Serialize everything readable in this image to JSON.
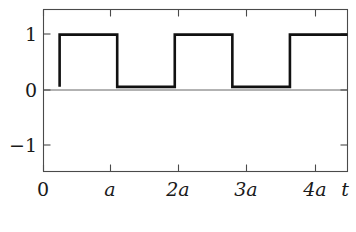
{
  "figure": {
    "kind": "mathematical-plot",
    "caption_partial": "",
    "background_color": "#ffffff",
    "frame_color": "#4a4a4a",
    "curve_color": "#111111"
  },
  "chart_data": {
    "type": "line",
    "title": "",
    "subtitle": "",
    "xlabel": "t",
    "ylabel": "",
    "grid": false,
    "legend": null,
    "legend_position": "none",
    "step_interpolation": "post",
    "xlim": [
      -0.28,
      5.0
    ],
    "ylim": [
      -1.62,
      1.48
    ],
    "xticks": [
      0,
      1,
      2,
      3,
      4
    ],
    "xticklabels": [
      "0",
      "a",
      "2a",
      "3a",
      "4a"
    ],
    "yticks": [
      1,
      0,
      -1
    ],
    "yticklabels": [
      "1",
      "0",
      "−1"
    ],
    "axis_tail_label": "t",
    "series": [
      {
        "name": "square wave",
        "x": [
          0,
          0,
          1,
          1,
          2,
          2,
          3,
          3,
          4,
          4,
          5
        ],
        "y": [
          0,
          1,
          1,
          0,
          0,
          1,
          1,
          0,
          0,
          1,
          1
        ]
      }
    ],
    "annotations": []
  }
}
